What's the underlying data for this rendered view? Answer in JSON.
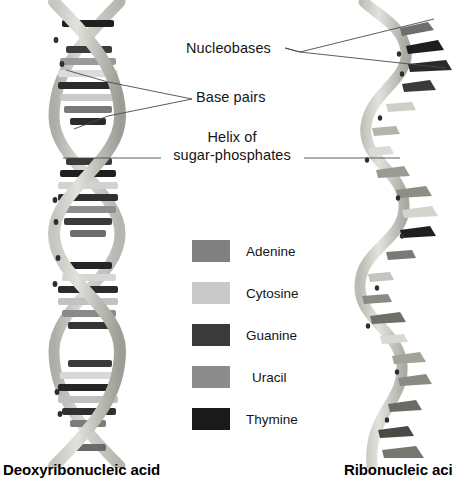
{
  "diagram": {
    "title_dna": "Deoxyribonucleic acid",
    "title_rna": "Ribonucleic aci",
    "callouts": {
      "nucleobases": "Nucleobases",
      "base_pairs": "Base pairs",
      "helix_line1": "Helix of",
      "helix_line2": "sugar-phosphates"
    }
  },
  "legend": {
    "items": [
      {
        "label": "Adenine",
        "color": "#808080",
        "indented": false
      },
      {
        "label": "Cytosine",
        "color": "#c9c9c9",
        "indented": false
      },
      {
        "label": "Guanine",
        "color": "#3a3a3a",
        "indented": false
      },
      {
        "label": "Uracil",
        "color": "#8c8c8c",
        "indented": true
      },
      {
        "label": "Thymine",
        "color": "#1a1a1a",
        "indented": false
      }
    ]
  },
  "palette": {
    "backbone_light": "#d8d7d2",
    "backbone_mid": "#b9b8b2",
    "backbone_dark": "#9a9992",
    "leader_line": "#4a4a4a",
    "background": "#ffffff"
  },
  "chart_data": {
    "type": "diagram",
    "structures": [
      {
        "name": "Deoxyribonucleic acid",
        "form": "double helix",
        "strands": 2,
        "side": "left",
        "features": [
          "Base pairs",
          "Helix of sugar-phosphates"
        ],
        "bases": [
          "Adenine",
          "Cytosine",
          "Guanine",
          "Thymine"
        ]
      },
      {
        "name": "Ribonucleic acid",
        "form": "single strand",
        "strands": 1,
        "side": "right",
        "features": [
          "Nucleobases",
          "Helix of sugar-phosphates"
        ],
        "bases": [
          "Adenine",
          "Cytosine",
          "Guanine",
          "Uracil"
        ]
      }
    ],
    "legend_entries": [
      "Adenine",
      "Cytosine",
      "Guanine",
      "Uracil",
      "Thymine"
    ],
    "legend_colors": [
      "#808080",
      "#c9c9c9",
      "#3a3a3a",
      "#8c8c8c",
      "#1a1a1a"
    ]
  }
}
